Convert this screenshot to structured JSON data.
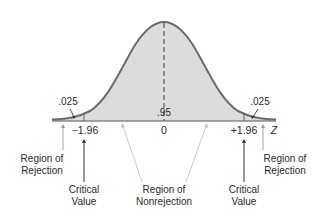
{
  "diagram": {
    "type": "normal-distribution-two-tailed-test",
    "colors": {
      "curve": "#6b6b6b",
      "fill": "#dcdcdc",
      "axis": "#555555",
      "arrow_dark": "#333333",
      "arrow_light": "#bdbdbd",
      "text": "#2a2a2a"
    },
    "areas": {
      "left_tail": ".025",
      "center": ".95",
      "right_tail": ".025"
    },
    "axis": {
      "ticks": [
        "−1.96",
        "0",
        "+1.96"
      ],
      "variable": "Z"
    },
    "annotations": {
      "left_rejection": [
        "Region of",
        "Rejection"
      ],
      "right_rejection": [
        "Region of",
        "Rejection"
      ],
      "left_critical": [
        "Critical",
        "Value"
      ],
      "right_critical": [
        "Critical",
        "Value"
      ],
      "nonrejection": [
        "Region of",
        "Nonrejection"
      ]
    }
  }
}
